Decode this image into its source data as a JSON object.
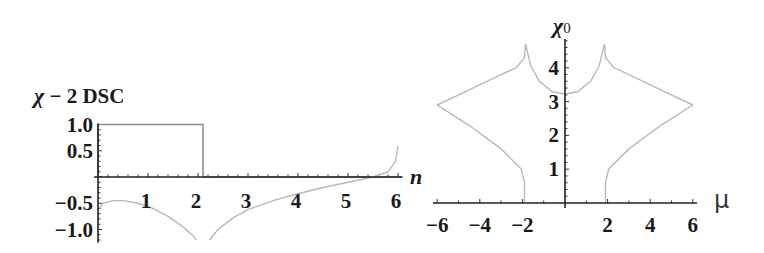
{
  "chart_data": [
    {
      "type": "line",
      "title": "χ − 2 DSC",
      "ylabel": "χ − 2 DSC",
      "xlabel": "n",
      "xlim": [
        0,
        6.1
      ],
      "ylim": [
        -1.2,
        1.0
      ],
      "x_ticks": [
        "1",
        "2",
        "3",
        "4",
        "5",
        "6"
      ],
      "y_ticks": [
        "1.0",
        "0.5",
        "−0.5",
        "−1.0"
      ],
      "grid": false,
      "series": [
        {
          "name": "step",
          "x": [
            0,
            0,
            2.1,
            2.1,
            6.1
          ],
          "y": [
            0,
            1.0,
            1.0,
            0,
            0
          ]
        },
        {
          "name": "curve-left-branch",
          "x": [
            0.02,
            0.1,
            0.3,
            0.5,
            0.8,
            1.1,
            1.4,
            1.7,
            1.9,
            1.97
          ],
          "y": [
            -0.6,
            -0.5,
            -0.45,
            -0.45,
            -0.5,
            -0.6,
            -0.75,
            -0.95,
            -1.12,
            -1.2
          ]
        },
        {
          "name": "curve-right-branch",
          "x": [
            2.23,
            2.4,
            2.7,
            3.0,
            3.5,
            4.0,
            4.5,
            5.0,
            5.5,
            5.8,
            5.95,
            6.0
          ],
          "y": [
            -1.2,
            -1.0,
            -0.78,
            -0.62,
            -0.45,
            -0.32,
            -0.2,
            -0.1,
            0.0,
            0.1,
            0.3,
            0.6
          ]
        }
      ]
    },
    {
      "type": "line",
      "title": "χ0",
      "ylabel": "χ0",
      "xlabel": "μ",
      "xlim": [
        -6.2,
        6.2
      ],
      "ylim": [
        0,
        4.75
      ],
      "x_ticks": [
        "−6",
        "−4",
        "−2",
        "2",
        "4",
        "6"
      ],
      "y_ticks": [
        "1",
        "2",
        "3",
        "4"
      ],
      "grid": false,
      "series": [
        {
          "name": "left-lower",
          "x": [
            -1.9,
            -1.9,
            -2.05,
            -3.0,
            -4.5,
            -6.0
          ],
          "y": [
            0,
            0.6,
            1.0,
            1.6,
            2.3,
            2.9
          ]
        },
        {
          "name": "left-upper",
          "x": [
            -6.0,
            -4.5,
            -3.0,
            -2.3,
            -1.9,
            -1.85
          ],
          "y": [
            2.9,
            3.35,
            3.8,
            4.0,
            4.3,
            4.7
          ]
        },
        {
          "name": "middle-arc",
          "x": [
            -1.85,
            -1.6,
            -1.2,
            -0.6,
            0.0,
            0.6,
            1.2,
            1.6,
            1.85
          ],
          "y": [
            4.7,
            4.05,
            3.6,
            3.3,
            3.22,
            3.3,
            3.6,
            4.05,
            4.7
          ]
        },
        {
          "name": "right-upper",
          "x": [
            1.85,
            1.9,
            2.3,
            3.0,
            4.5,
            6.0
          ],
          "y": [
            4.7,
            4.3,
            4.0,
            3.8,
            3.35,
            2.9
          ]
        },
        {
          "name": "right-lower",
          "x": [
            6.0,
            4.5,
            3.0,
            2.05,
            1.9,
            1.9
          ],
          "y": [
            2.9,
            2.3,
            1.6,
            1.0,
            0.6,
            0
          ]
        }
      ]
    }
  ],
  "left_plot": {
    "ylabel_parts": {
      "chi": "χ",
      "rest": " − 2 DSC"
    },
    "xlabel": "n",
    "y_ticks": [
      {
        "label": "1.0",
        "value": 1.0
      },
      {
        "label": "0.5",
        "value": 0.5
      },
      {
        "label": "−0.5",
        "value": -0.5
      },
      {
        "label": "−1.0",
        "value": -1.0
      }
    ],
    "x_ticks": [
      {
        "label": "1",
        "value": 1
      },
      {
        "label": "2",
        "value": 2
      },
      {
        "label": "3",
        "value": 3
      },
      {
        "label": "4",
        "value": 4
      },
      {
        "label": "5",
        "value": 5
      },
      {
        "label": "6",
        "value": 6
      }
    ]
  },
  "right_plot": {
    "ylabel_main": "χ",
    "ylabel_sub": "0",
    "xlabel": "μ",
    "y_ticks": [
      {
        "label": "1",
        "value": 1
      },
      {
        "label": "2",
        "value": 2
      },
      {
        "label": "3",
        "value": 3
      },
      {
        "label": "4",
        "value": 4
      }
    ],
    "x_ticks": [
      {
        "label": "−6",
        "value": -6
      },
      {
        "label": "−4",
        "value": -4
      },
      {
        "label": "−2",
        "value": -2
      },
      {
        "label": "2",
        "value": 2
      },
      {
        "label": "4",
        "value": 4
      },
      {
        "label": "6",
        "value": 6
      }
    ]
  },
  "colors": {
    "axis": "#222222",
    "step": "#8a8a8a",
    "curve": "#b8b8b8",
    "text": "#1a1a1a"
  }
}
